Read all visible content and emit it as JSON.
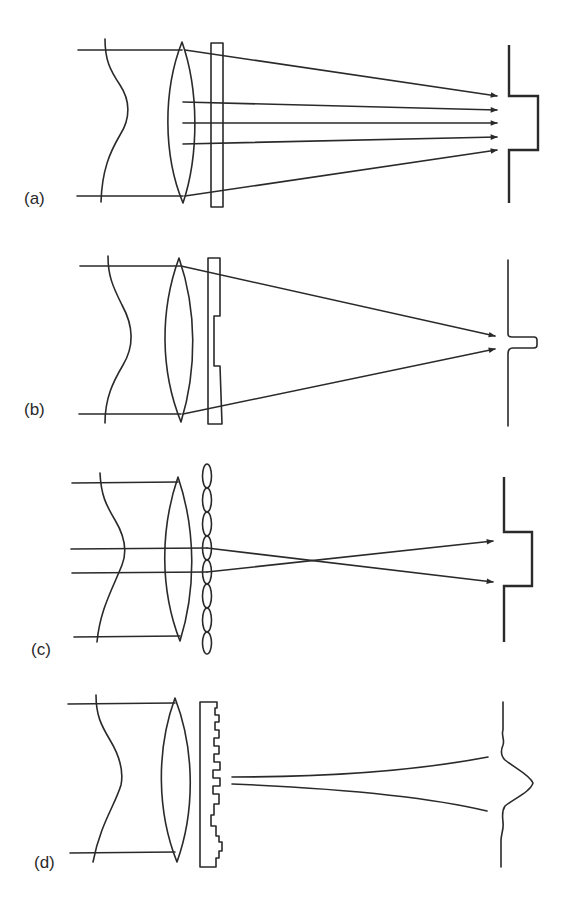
{
  "figure": {
    "colors": {
      "line": "#2a2a2a",
      "background": "#ffffff"
    },
    "panels": [
      {
        "id": "a",
        "label": "(a)",
        "element": "flat plate",
        "ray_count": 5,
        "output_profile": "flat-top step"
      },
      {
        "id": "b",
        "label": "(b)",
        "element": "stepped phase plate",
        "ray_count": 2,
        "output_profile": "narrow peak"
      },
      {
        "id": "c",
        "label": "(c)",
        "element": "lenslet array",
        "ray_count": 2,
        "output_profile": "flat-top step"
      },
      {
        "id": "d",
        "label": "(d)",
        "element": "multi-level diffractive element",
        "ray_count": 2,
        "output_profile": "sinc-like peak with side lobes"
      }
    ]
  }
}
